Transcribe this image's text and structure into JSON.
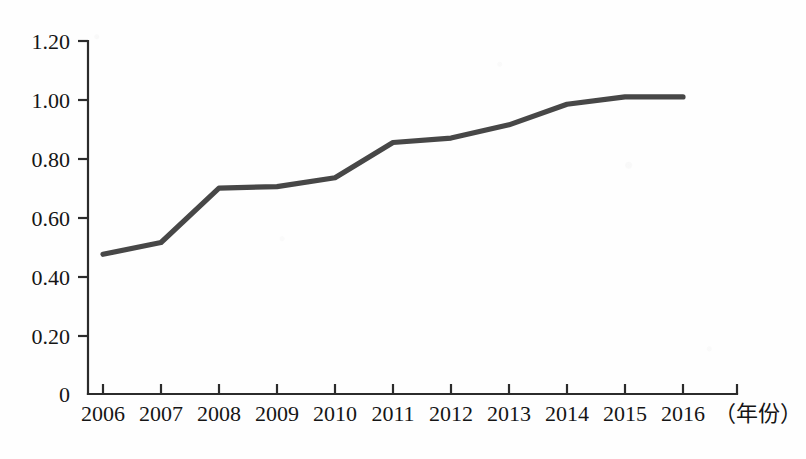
{
  "chart_data": {
    "type": "line",
    "title": "",
    "subtitle": "",
    "xlabel": "（年份）",
    "ylabel": "",
    "categories": [
      "2006",
      "2007",
      "2008",
      "2009",
      "2010",
      "2011",
      "2012",
      "2013",
      "2014",
      "2015",
      "2016"
    ],
    "x": [
      2006,
      2007,
      2008,
      2009,
      2010,
      2011,
      2012,
      2013,
      2014,
      2015,
      2016
    ],
    "values": [
      0.475,
      0.515,
      0.7,
      0.705,
      0.735,
      0.855,
      0.87,
      0.915,
      0.985,
      1.01,
      1.01
    ],
    "series": [
      {
        "name": "",
        "values": [
          0.475,
          0.515,
          0.7,
          0.705,
          0.735,
          0.855,
          0.87,
          0.915,
          0.985,
          1.01,
          1.01
        ]
      }
    ],
    "ylim": [
      0,
      1.2
    ],
    "xlim": [
      2006,
      2016
    ],
    "ytick_values": [
      0,
      0.2,
      0.4,
      0.6,
      0.8,
      1.0,
      1.2
    ],
    "ytick_labels": [
      "0",
      "0.20",
      "0.40",
      "0.60",
      "0.80",
      "1.00",
      "1.20"
    ],
    "xtick_labels": [
      "2006",
      "2007",
      "2008",
      "2009",
      "2010",
      "2011",
      "2012",
      "2013",
      "2014",
      "2015",
      "2016"
    ],
    "grid": false,
    "legend": "none",
    "line_color": "#474747",
    "axis_color": "#2b2b2b",
    "background_color": "#fefefe"
  },
  "axis": {
    "x_caption": "（年份）",
    "y_labels": [
      "1.20",
      "1.00",
      "0.80",
      "0.60",
      "0.40",
      "0.20",
      "0"
    ],
    "x_labels": [
      "2006",
      "2007",
      "2008",
      "2009",
      "2010",
      "2011",
      "2012",
      "2013",
      "2014",
      "2015",
      "2016"
    ]
  }
}
